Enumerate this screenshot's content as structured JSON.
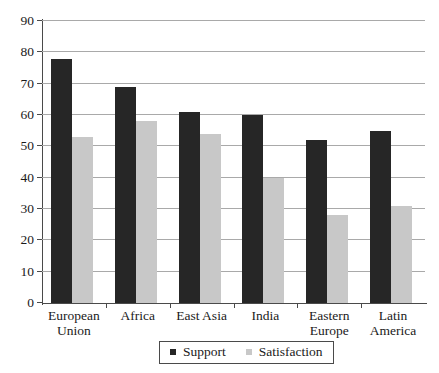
{
  "chart_data": {
    "type": "bar",
    "title": "",
    "subtitle": "",
    "xlabel": "",
    "ylabel": "",
    "ylim": [
      0,
      90
    ],
    "yticks": [
      0,
      10,
      20,
      30,
      40,
      50,
      60,
      70,
      80,
      90
    ],
    "ytick_labels": [
      "0",
      "10",
      "20",
      "30",
      "40",
      "50",
      "60",
      "70",
      "80",
      "90"
    ],
    "grid": true,
    "legend_position": "bottom-center",
    "categories": [
      "European Union",
      "Africa",
      "East Asia",
      "India",
      "Eastern Europe",
      "Latin America"
    ],
    "category_lines": [
      [
        "European",
        "Union"
      ],
      [
        "Africa"
      ],
      [
        "East Asia"
      ],
      [
        "India"
      ],
      [
        "Eastern",
        "Europe"
      ],
      [
        "Latin",
        "America"
      ]
    ],
    "series": [
      {
        "name": "Support",
        "color": "#262626",
        "values": [
          78,
          69,
          61,
          60,
          52,
          55
        ]
      },
      {
        "name": "Satisfaction",
        "color": "#c8c8c8",
        "values": [
          53,
          58,
          54,
          40,
          28,
          31
        ]
      }
    ]
  },
  "legend": {
    "entries": [
      {
        "label": "Support",
        "marker": "square-dark"
      },
      {
        "label": "Satisfaction",
        "marker": "square-light"
      }
    ]
  },
  "colors": {
    "support": "#262626",
    "satisfaction": "#c8c8c8",
    "gridline": "#a9a9a9",
    "axis": "#4a4a4a",
    "text": "#1a1a1a",
    "background": "#ffffff"
  }
}
